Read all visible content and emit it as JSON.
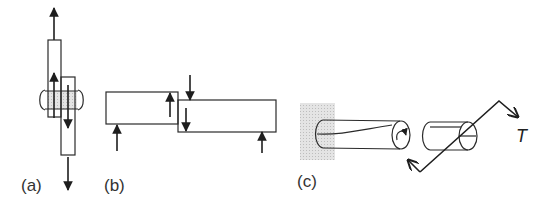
{
  "figure": {
    "panels": [
      {
        "id": "a",
        "label": "(a)",
        "description": "Lap joint with rivet in tension (single shear)"
      },
      {
        "id": "b",
        "label": "(b)",
        "description": "Two offset blocks with transverse shear forces"
      },
      {
        "id": "c",
        "label": "(c)",
        "description": "Shaft fixed to wall under torque T"
      }
    ],
    "torque_label": "T",
    "colors": {
      "line": "#2a2a2a",
      "hatch": "#d9d9d9",
      "background": "#ffffff"
    }
  }
}
